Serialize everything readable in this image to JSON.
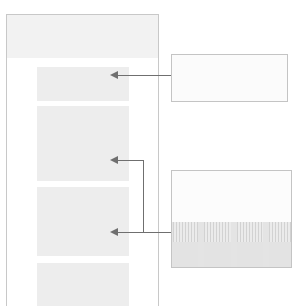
{
  "canvas": {
    "width": 294,
    "height": 306,
    "background_color": "#ffffff"
  },
  "document_panel": {
    "name": "document-page",
    "border_color": "#c8c8c8",
    "header": {
      "label": "",
      "fill_color": "#f2f2f2"
    },
    "blocks": [
      {
        "id": "block-1",
        "label": "",
        "fill_color": "#ededed"
      },
      {
        "id": "block-2",
        "label": "",
        "fill_color": "#ededed"
      },
      {
        "id": "block-3",
        "label": "",
        "fill_color": "#ededed"
      },
      {
        "id": "block-4",
        "label": "",
        "fill_color": "#ededed"
      }
    ]
  },
  "callouts": [
    {
      "id": "callout-top",
      "label": "",
      "border_color": "#c4c4c4",
      "fill_color": "#fbfbfb",
      "has_chart": false
    },
    {
      "id": "callout-bottom",
      "label": "",
      "border_color": "#c4c4c4",
      "fill_color": "#fbfbfb",
      "has_chart": true
    }
  ],
  "connectors": [
    {
      "id": "connector-1",
      "from": "callout-top",
      "to": "block-1",
      "style": "straight",
      "color": "#6f6f6f"
    },
    {
      "id": "connector-2",
      "from": "callout-bottom",
      "to": "block-2",
      "style": "elbow",
      "color": "#6f6f6f"
    },
    {
      "id": "connector-3",
      "from": "callout-bottom",
      "to": "block-3",
      "style": "straight",
      "color": "#6f6f6f"
    }
  ],
  "chart_data": {
    "type": "bar",
    "title": "",
    "xlabel": "",
    "ylabel": "",
    "categories": [
      "1",
      "2",
      "3",
      "4"
    ],
    "values": [
      1,
      1,
      1,
      1
    ],
    "grid": false,
    "legend": null,
    "note": "four striped vertical bands separated by white gaps"
  }
}
